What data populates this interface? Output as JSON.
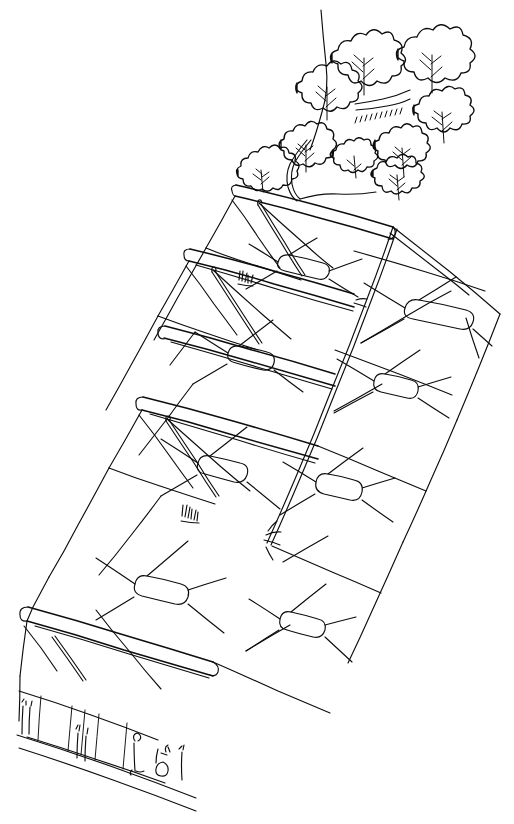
{
  "artwork": {
    "title": "Terraced Rooftop Garden Building — Perspective Sketch",
    "medium": "pen and ink line drawing",
    "technique": "freehand contour line, no shading, no hatching fill",
    "background_color": "#ffffff",
    "ink_color": "#0d0d0d",
    "canvas": {
      "width": 514,
      "height": 824
    },
    "orientation": "portrait",
    "viewpoint": "elevated three-quarter aerial perspective looking down a diagonal street axis",
    "line_quality": "wobbly hand-drawn single-weight contour, occasional doubled lines on structural members"
  },
  "scene": {
    "subject": "stepped terraced building with cable-net / tensile membrane roof canopy and rooftop tree planting",
    "parts": [
      {
        "name": "rooftop-vegetation",
        "label": "Rooftop trees and shrubs",
        "description": "cluster of scalloped cloud-shaped deciduous tree canopies with visible branch veins, spilling over the uppermost terrace parapet",
        "count_masses": 9,
        "location": "top of image, upper-right quadrant"
      },
      {
        "name": "upper-terrace",
        "label": "Upper terrace deck",
        "description": "highest stepped terrace slab with doubled parapet edge band, tree planter behind",
        "level": 4
      },
      {
        "name": "second-terrace",
        "label": "Second terrace deck",
        "description": "stepped terrace slab with curved upturned parapet nose at left end",
        "level": 3
      },
      {
        "name": "third-terrace",
        "label": "Third terrace deck",
        "description": "stepped terrace slab with small planted shrub cluster on its edge",
        "level": 2
      },
      {
        "name": "lowest-terrace",
        "label": "Lowest terrace deck",
        "description": "bottom-most stepped slab above the street facade, doubled edge band",
        "level": 1
      },
      {
        "name": "cable-net-canopy",
        "label": "Tensile cable-net canopy",
        "description": "diagonal grid of tensioned cables forming diamond bays, each bay pinched to a rounded-rectangle oculus at its centre",
        "bay_openings": 7,
        "location": "right half of image"
      },
      {
        "name": "ridge-masts",
        "label": "Ridge masts and stay cables",
        "description": "triangular peaked masts drawn as doubled lines rising from each terrace edge, with stay cables running to the deck corners",
        "count": 4
      },
      {
        "name": "long-diagonal-cable",
        "label": "Primary spine cable",
        "description": "single long doubled diagonal line running from upper-right down to lower-left through all canopy bays"
      },
      {
        "name": "street-facade",
        "label": "Street-level facade",
        "description": "low ground-floor elevation with vertical mullion divisions at the bottom-left",
        "bays": 5
      },
      {
        "name": "street-figures",
        "label": "People and street furniture",
        "description": "small gestural stick figures, a bicycle and bollards along the kerb",
        "count": 6
      },
      {
        "name": "kerb-line",
        "label": "Kerb / pavement edge",
        "description": "two long nearly-parallel lines receding to the lower right edge of the sheet"
      },
      {
        "name": "terrace-shrubs",
        "label": "Terrace edge shrub clusters",
        "description": "two tiny scribbled planting clumps sitting on terrace parapets",
        "count": 2
      }
    ]
  },
  "notes": {
    "no_text": "The drawing contains no lettering, labels, dimensions, scale bar or title block.",
    "no_color": "Monochrome — black ink on plain white paper, no wash or tone."
  }
}
